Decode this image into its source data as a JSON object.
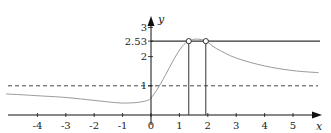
{
  "chart_data": {
    "type": "line",
    "title": "",
    "xlabel": "x",
    "ylabel": "y",
    "xlim": [
      -5.2,
      5.9
    ],
    "ylim": [
      0,
      3.2
    ],
    "x_ticks": [
      -4,
      -3,
      -2,
      -1,
      0,
      1,
      2,
      3,
      4,
      5
    ],
    "x_tick_labels": [
      "-4",
      "-3",
      "-2",
      "-1",
      "0",
      "1",
      "2",
      "3",
      "4",
      "5"
    ],
    "y_ticks": [
      1,
      2,
      2.53,
      3
    ],
    "y_tick_labels": [
      "1",
      "2",
      "2.53",
      "3"
    ],
    "grid": false,
    "series": [
      {
        "name": "f(x)",
        "style": "solid-gray",
        "x": [
          -5.1,
          -4.5,
          -4,
          -3,
          -2,
          -1.2,
          -0.8,
          -0.4,
          -0.1,
          0,
          0.2,
          0.5,
          0.8,
          1.1,
          1.33,
          1.6,
          1.93,
          2.3,
          3,
          4,
          5,
          5.9
        ],
        "y": [
          0.72,
          0.69,
          0.66,
          0.6,
          0.5,
          0.42,
          0.41,
          0.44,
          0.51,
          0.58,
          0.85,
          1.35,
          1.9,
          2.35,
          2.53,
          2.6,
          2.53,
          2.28,
          1.95,
          1.68,
          1.52,
          1.45
        ]
      },
      {
        "name": "y = 1 asymptote",
        "style": "dashed",
        "x": [
          -5.1,
          5.9
        ],
        "y": [
          1,
          1
        ]
      },
      {
        "name": "y = 2.53",
        "style": "solid",
        "x": [
          0,
          5.9
        ],
        "y": [
          2.53,
          2.53
        ]
      }
    ],
    "annotations": [
      {
        "type": "open-circle",
        "x": 1.33,
        "y": 2.53
      },
      {
        "type": "open-circle",
        "x": 1.93,
        "y": 2.53
      },
      {
        "type": "vertical-segment",
        "x": 1.33,
        "y": [
          0,
          2.53
        ]
      },
      {
        "type": "vertical-segment",
        "x": 1.93,
        "y": [
          0,
          2.53
        ]
      }
    ]
  },
  "layout": {
    "origin_px": [
      151,
      115
    ],
    "unit_x_px": 28.4,
    "unit_y_px": 29.2,
    "x_axis_range_px": [
      8,
      322
    ],
    "y_axis_top_px": 16,
    "curve_color": "#9a9a9a",
    "axis_color": "#111111",
    "line_color": "#333333"
  }
}
